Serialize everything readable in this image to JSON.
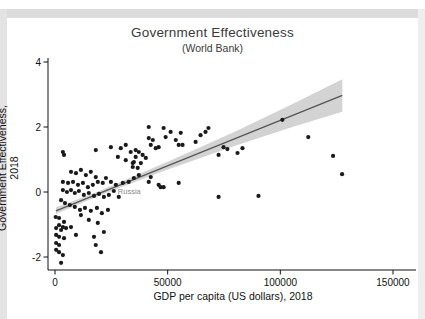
{
  "titles": {
    "title": "Government Effectiveness",
    "subtitle": "(World Bank)"
  },
  "colors": {
    "point": "#1a1a1a",
    "fit_line": "#555555",
    "ci_band": "#d3d3d3",
    "axis": "#111111",
    "annotation": "#8a8a8a",
    "title_text": "#3a3a3a"
  },
  "chart_data": {
    "type": "scatter",
    "title": "Government Effectiveness",
    "subtitle": "(World Bank)",
    "xlabel": "GDP per capita (US dollars), 2018",
    "ylabel": "Government Effectiveness, 2018",
    "xlim": [
      0,
      160000
    ],
    "ylim": [
      -2.4,
      4
    ],
    "x_ticks": [
      {
        "v": 0,
        "label": "0"
      },
      {
        "v": 50000,
        "label": "50000"
      },
      {
        "v": 100000,
        "label": "100000"
      },
      {
        "v": 150000,
        "label": "150000"
      }
    ],
    "y_ticks": [
      {
        "v": 4,
        "label": "4"
      },
      {
        "v": 2,
        "label": "2"
      },
      {
        "v": 0,
        "label": "0"
      },
      {
        "v": -2,
        "label": "-2"
      }
    ],
    "grid": false,
    "legend": "none",
    "annotation": {
      "text": "Russia",
      "x": 26100,
      "y": 0.03
    },
    "fit_line": {
      "x": [
        400,
        127500
      ],
      "y": [
        -0.58,
        2.97
      ]
    },
    "ci_band": {
      "x": [
        400,
        20000,
        50000,
        80000,
        105000,
        127500
      ],
      "mid": [
        -0.58,
        -0.03,
        0.81,
        1.64,
        2.34,
        2.97
      ],
      "half": [
        0.1,
        0.07,
        0.12,
        0.22,
        0.35,
        0.5
      ]
    },
    "points": [
      [
        300,
        -0.77
      ],
      [
        1800,
        -0.8
      ],
      [
        4000,
        -0.92
      ],
      [
        1800,
        -1.02
      ],
      [
        3500,
        -1.08
      ],
      [
        500,
        -1.11
      ],
      [
        2700,
        -1.17
      ],
      [
        4900,
        -1.11
      ],
      [
        7100,
        -1.08
      ],
      [
        500,
        -1.32
      ],
      [
        1800,
        -1.38
      ],
      [
        4000,
        -1.42
      ],
      [
        9300,
        -1.32
      ],
      [
        500,
        -1.57
      ],
      [
        1800,
        -1.63
      ],
      [
        18100,
        -1.63
      ],
      [
        17300,
        -1.38
      ],
      [
        500,
        -1.78
      ],
      [
        1800,
        -1.85
      ],
      [
        3500,
        -1.94
      ],
      [
        20400,
        -1.85
      ],
      [
        2700,
        -2.18
      ],
      [
        11500,
        -0.71
      ],
      [
        15000,
        -0.86
      ],
      [
        19000,
        -0.95
      ],
      [
        21700,
        -1.23
      ],
      [
        3500,
        0.31
      ],
      [
        5800,
        0.28
      ],
      [
        8000,
        0.31
      ],
      [
        10200,
        0.22
      ],
      [
        12400,
        0.28
      ],
      [
        14600,
        0.15
      ],
      [
        16800,
        0.22
      ],
      [
        19000,
        0.31
      ],
      [
        21200,
        0.28
      ],
      [
        18100,
        0.46
      ],
      [
        22600,
        0.43
      ],
      [
        24800,
        0.31
      ],
      [
        27000,
        0.22
      ],
      [
        30100,
        0.28
      ],
      [
        32700,
        0.31
      ],
      [
        35000,
        0.43
      ],
      [
        37200,
        0.52
      ],
      [
        7100,
        0.62
      ],
      [
        9300,
        0.58
      ],
      [
        11500,
        0.68
      ],
      [
        13700,
        0.52
      ],
      [
        15900,
        0.62
      ],
      [
        4000,
        1.14
      ],
      [
        3500,
        0.06
      ],
      [
        5300,
        0.0
      ],
      [
        7100,
        0.06
      ],
      [
        8800,
        -0.03
      ],
      [
        10600,
        0.03
      ],
      [
        12800,
        -0.09
      ],
      [
        15000,
        -0.03
      ],
      [
        17300,
        -0.12
      ],
      [
        19500,
        -0.06
      ],
      [
        21700,
        -0.15
      ],
      [
        23900,
        -0.09
      ],
      [
        26100,
        0.03
      ],
      [
        28300,
        -0.15
      ],
      [
        2700,
        -0.25
      ],
      [
        4400,
        -0.34
      ],
      [
        6600,
        -0.4
      ],
      [
        8800,
        -0.46
      ],
      [
        11100,
        -0.55
      ],
      [
        13300,
        -0.49
      ],
      [
        15900,
        -0.58
      ],
      [
        18600,
        -0.49
      ],
      [
        20800,
        -0.65
      ],
      [
        23500,
        -0.55
      ],
      [
        3500,
        1.23
      ],
      [
        18100,
        1.29
      ],
      [
        24800,
        1.38
      ],
      [
        29200,
        1.35
      ],
      [
        31400,
        1.45
      ],
      [
        33600,
        1.23
      ],
      [
        35800,
        1.29
      ],
      [
        27900,
        1.08
      ],
      [
        31400,
        0.98
      ],
      [
        34500,
        0.89
      ],
      [
        40300,
        1.05
      ],
      [
        38100,
        0.89
      ],
      [
        41600,
        2.0
      ],
      [
        48200,
        1.97
      ],
      [
        51300,
        1.85
      ],
      [
        55800,
        1.82
      ],
      [
        49100,
        1.69
      ],
      [
        41600,
        1.66
      ],
      [
        43400,
        1.6
      ],
      [
        53600,
        1.6
      ],
      [
        54900,
        1.45
      ],
      [
        56600,
        1.45
      ],
      [
        44700,
        1.35
      ],
      [
        46000,
        1.38
      ],
      [
        35800,
        1.08
      ],
      [
        37200,
        1.23
      ],
      [
        38900,
        1.14
      ],
      [
        35000,
        0.92
      ],
      [
        36700,
        0.74
      ],
      [
        34500,
        0.77
      ],
      [
        42500,
        1.45
      ],
      [
        62400,
        1.54
      ],
      [
        64600,
        1.75
      ],
      [
        66800,
        1.85
      ],
      [
        68100,
        1.97
      ],
      [
        74800,
        1.38
      ],
      [
        72600,
        1.14
      ],
      [
        76500,
        1.32
      ],
      [
        41600,
        0.31
      ],
      [
        46000,
        0.22
      ],
      [
        54900,
        0.28
      ],
      [
        46900,
        0.15
      ],
      [
        42500,
        0.46
      ],
      [
        48200,
        0.15
      ],
      [
        72600,
        -0.15
      ],
      [
        90300,
        -0.12
      ],
      [
        81000,
        1.2
      ],
      [
        83200,
        1.35
      ],
      [
        100900,
        2.22
      ],
      [
        112400,
        1.69
      ],
      [
        123400,
        1.11
      ],
      [
        127400,
        0.55
      ]
    ]
  }
}
